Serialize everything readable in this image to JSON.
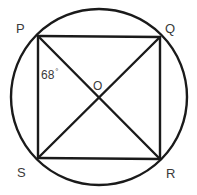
{
  "figure": {
    "background_color": "#ffffff",
    "stroke_color": "#1a1a1a",
    "text_color": "#3a3a3a",
    "width": 197,
    "height": 195
  },
  "circle": {
    "name": "circumscribed-circle",
    "center_x": 99,
    "center_y": 97,
    "radius": 88,
    "stroke_width": 2.4
  },
  "vertices": {
    "P": {
      "label": "P",
      "x": 38,
      "y": 36
    },
    "Q": {
      "label": "Q",
      "x": 160,
      "y": 37
    },
    "R": {
      "label": "R",
      "x": 160,
      "y": 159
    },
    "S": {
      "label": "S",
      "x": 38,
      "y": 158
    }
  },
  "center_point": {
    "label": "O",
    "x": 99,
    "y": 99
  },
  "sides": [
    {
      "name": "side-PQ",
      "from": "P",
      "to": "Q"
    },
    {
      "name": "side-QR",
      "from": "Q",
      "to": "R"
    },
    {
      "name": "side-RS",
      "from": "R",
      "to": "S"
    },
    {
      "name": "side-SP",
      "from": "S",
      "to": "P"
    }
  ],
  "diagonals": [
    {
      "name": "diagonal-PR",
      "from": "P",
      "to": "R"
    },
    {
      "name": "diagonal-QS",
      "from": "Q",
      "to": "S"
    }
  ],
  "angle_annotation": {
    "value": "68",
    "degree_symbol": "°",
    "at_vertex": "P",
    "between": "SP and PR"
  }
}
